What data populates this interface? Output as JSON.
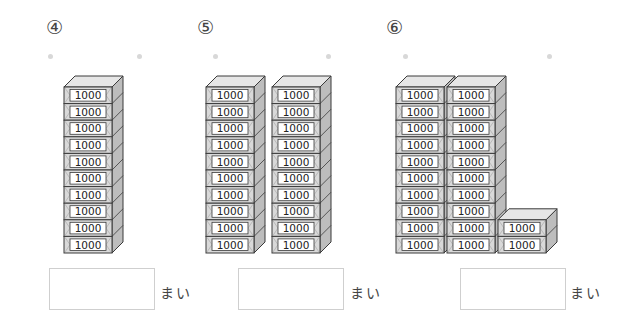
{
  "bill": {
    "denomination": "1000"
  },
  "unit_label": "まい",
  "problems": [
    {
      "label": "④",
      "label_x": 46,
      "dots": [
        48,
        137
      ],
      "stacks": [
        {
          "x": 64,
          "count": 10
        }
      ],
      "answer_box_x": 49,
      "unit_x": 160,
      "answer_value": ""
    },
    {
      "label": "⑤",
      "label_x": 197,
      "dots": [
        213,
        326
      ],
      "stacks": [
        {
          "x": 206,
          "count": 10
        },
        {
          "x": 272,
          "count": 10
        }
      ],
      "answer_box_x": 238,
      "unit_x": 350,
      "answer_value": ""
    },
    {
      "label": "⑥",
      "label_x": 386,
      "dots": [
        403,
        547
      ],
      "stacks": [
        {
          "x": 396,
          "count": 10
        },
        {
          "x": 447,
          "count": 10
        },
        {
          "x": 498,
          "count": 2
        }
      ],
      "answer_box_x": 460,
      "unit_x": 570,
      "answer_value": ""
    }
  ],
  "colors": {
    "front": "#d9d9d9",
    "top": "#e6e6e6",
    "side": "#bdbdbd",
    "outline": "#3a3a3a",
    "label_bg": "#ffffff"
  }
}
